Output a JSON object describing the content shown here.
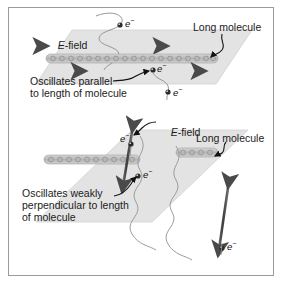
{
  "figure": {
    "domain": "Diagram",
    "title_text": "",
    "background_color": "#ffffff",
    "border_color": "#9a9a9a",
    "plane_fill_color": "#e3e3e3",
    "plane_edge_color": "#c9c9c9",
    "arrow_color": "#4a4a4a",
    "molecule_color": "#b9b9b9",
    "molecule_outline_color": "#8e8e8e",
    "text_color": "#1b1b1b",
    "wave_color": "#9b9b9b",
    "leader_color": "#111111"
  },
  "panels": [
    {
      "id": "top-panel",
      "name": "parallel-oscillation-panel",
      "efield_label": "E-field",
      "efield_italic_part": "E",
      "efield_rest": "-field",
      "molecule_label": "Long molecule",
      "caption_lines": [
        "Oscillates parallel",
        "to length of molecule"
      ],
      "caption_full": "Oscillates parallel to length of molecule",
      "electron_labels": [
        "e",
        "e",
        "e"
      ],
      "electron_charge": "−",
      "field_direction": "horizontal",
      "arrow_count": 2,
      "molecule_orientation": "horizontal"
    },
    {
      "id": "bottom-panel",
      "name": "perpendicular-oscillation-panel",
      "efield_label": "E-field",
      "efield_italic_part": "E",
      "efield_rest": "-field",
      "molecule_label": "Long molecule",
      "caption_lines": [
        "Oscillates weakly",
        "perpendicular to length",
        "of molecule"
      ],
      "caption_full": "Oscillates weakly perpendicular to length of molecule",
      "electron_labels": [
        "e",
        "e",
        "e"
      ],
      "electron_charge": "−",
      "field_direction": "vertical",
      "arrow_count": 2,
      "molecule_orientation": "horizontal"
    }
  ],
  "icons": {
    "electron": "electron-icon",
    "double_arrow": "double-arrow-icon",
    "molecule_chain": "molecule-chain-icon",
    "wave": "sine-wave-icon",
    "leader": "leader-line-icon"
  }
}
